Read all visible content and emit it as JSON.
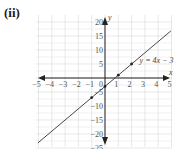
{
  "figure": {
    "label": "(ii)"
  },
  "chart_data": {
    "type": "line",
    "title": "",
    "xlabel": "x",
    "ylabel": "y",
    "xlim": [
      -5,
      5
    ],
    "ylim": [
      -25,
      20
    ],
    "x_ticks": [
      -5,
      -4,
      -3,
      -2,
      -1,
      0,
      1,
      2,
      3,
      4,
      5
    ],
    "y_ticks": [
      20,
      15,
      10,
      5,
      -5,
      -10,
      -15,
      -20,
      -25
    ],
    "grid": true,
    "series": [
      {
        "name": "y = 4x − 3",
        "equation": "y = 4x − 3",
        "slope": 4,
        "intercept": -3,
        "marked_points": [
          {
            "x": -1,
            "y": -7
          },
          {
            "x": 0,
            "y": -3
          },
          {
            "x": 1,
            "y": 1
          },
          {
            "x": 2,
            "y": 5
          }
        ]
      }
    ],
    "annotations": [
      "y = 4x − 3"
    ],
    "colors": {
      "line": "#333333",
      "grid": "#d8d8d8",
      "axis": "#222222"
    }
  }
}
